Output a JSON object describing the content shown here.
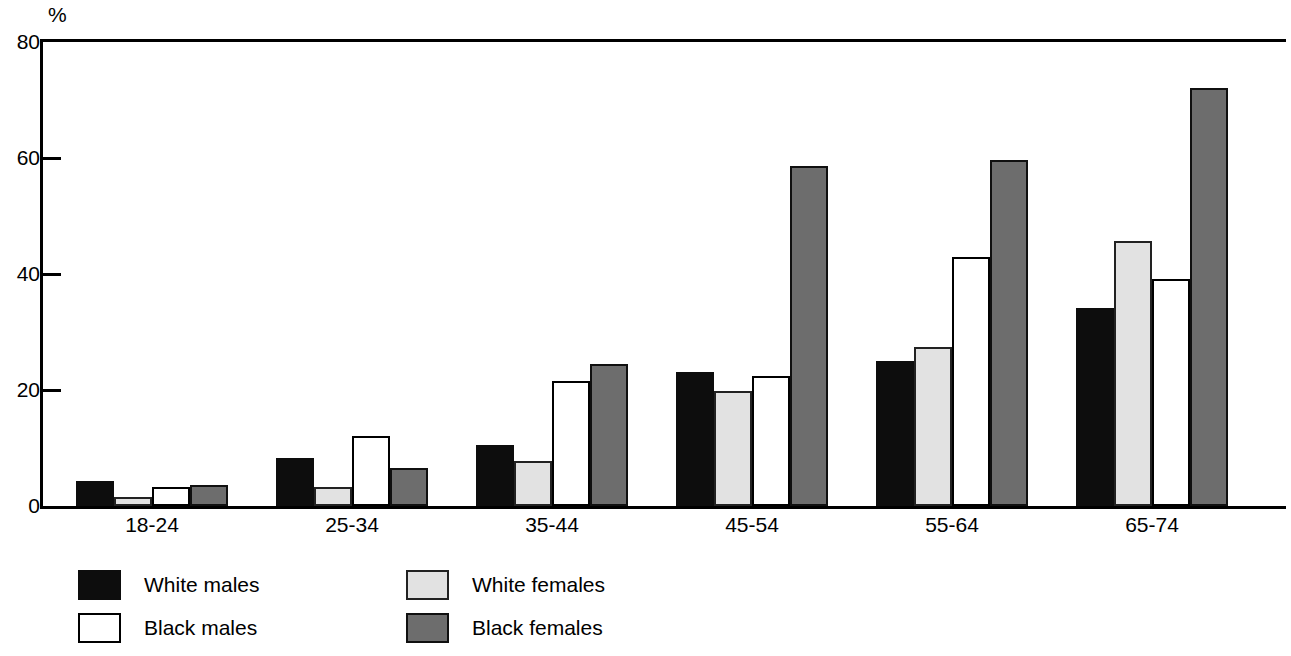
{
  "chart_data": {
    "type": "bar",
    "title": "",
    "subtitle": "",
    "xlabel": "",
    "ylabel": "%",
    "ylim": [
      0,
      80
    ],
    "yticks": [
      0,
      20,
      40,
      60,
      80
    ],
    "ytick_labels": [
      "0",
      "20",
      "40",
      "60",
      "80"
    ],
    "grid": false,
    "legend_position": "bottom-left",
    "categories": [
      "18-24",
      "25-34",
      "35-44",
      "45-54",
      "55-64",
      "65-74"
    ],
    "series": [
      {
        "name": "White males",
        "swatch": "black",
        "color": "#0d0d0d",
        "values": [
          4.3,
          8.2,
          10.6,
          23.1,
          25.0,
          34.1
        ]
      },
      {
        "name": "White females",
        "swatch": "lgray",
        "color": "#e2e2e2",
        "values": [
          1.5,
          3.2,
          7.7,
          19.9,
          27.4,
          45.7
        ]
      },
      {
        "name": "Black males",
        "swatch": "white",
        "color": "#ffffff",
        "values": [
          3.2,
          12.0,
          21.6,
          22.5,
          43.0,
          39.2
        ]
      },
      {
        "name": "Black females",
        "swatch": "dgray",
        "color": "#6d6d6d",
        "values": [
          3.7,
          6.6,
          24.5,
          58.6,
          59.6,
          72.1
        ]
      }
    ],
    "legend": [
      {
        "label": "White males",
        "swatch": "black"
      },
      {
        "label": "Black males",
        "swatch": "white"
      },
      {
        "label": "White females",
        "swatch": "lgray"
      },
      {
        "label": "Black females",
        "swatch": "dgray"
      }
    ],
    "series_draw_order": [
      "White males",
      "White females",
      "Black males",
      "Black females"
    ]
  }
}
